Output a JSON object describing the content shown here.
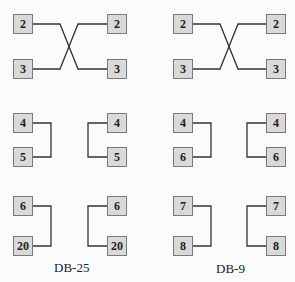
{
  "diagrams": [
    {
      "caption": "DB-25",
      "left_pins": [
        "2",
        "3",
        "4",
        "5",
        "6",
        "20"
      ],
      "right_pins": [
        "2",
        "3",
        "4",
        "5",
        "6",
        "20"
      ],
      "connections": [
        {
          "type": "crossover",
          "pins": [
            "2",
            "3"
          ]
        },
        {
          "type": "loopback",
          "pins": [
            "4",
            "5"
          ]
        },
        {
          "type": "loopback",
          "pins": [
            "6",
            "20"
          ]
        }
      ]
    },
    {
      "caption": "DB-9",
      "left_pins": [
        "2",
        "3",
        "4",
        "6",
        "7",
        "8"
      ],
      "right_pins": [
        "2",
        "3",
        "4",
        "6",
        "7",
        "8"
      ],
      "connections": [
        {
          "type": "crossover",
          "pins": [
            "2",
            "3"
          ]
        },
        {
          "type": "loopback",
          "pins": [
            "4",
            "6"
          ]
        },
        {
          "type": "loopback",
          "pins": [
            "7",
            "8"
          ]
        }
      ]
    }
  ],
  "colors": {
    "box_fill": "#d9d9d9",
    "box_border": "#7a7a7a",
    "line": "#333333"
  }
}
